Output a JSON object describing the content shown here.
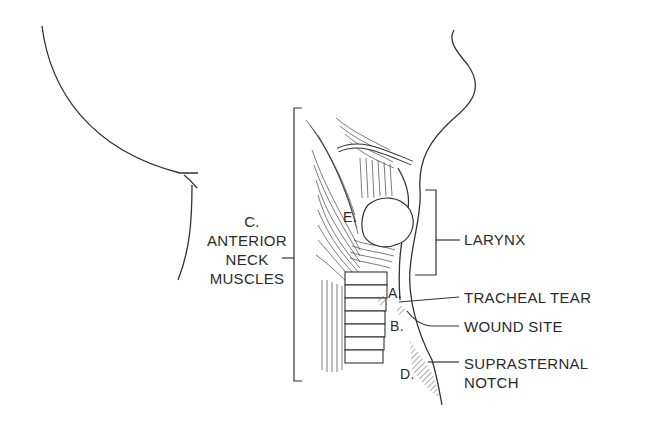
{
  "figure": {
    "colors": {
      "line": "#333333",
      "text": "#2b2b2b",
      "background": "#ffffff"
    },
    "labels": {
      "muscles": {
        "letter": "C.",
        "line1": "ANTERIOR",
        "line2": "NECK",
        "line3": "MUSCLES"
      },
      "larynx": "LARYNX",
      "tracheal_tear": "TRACHEAL TEAR",
      "wound_site": "WOUND SITE",
      "suprasternal_line1": "SUPRASTERNAL",
      "suprasternal_line2": "NOTCH",
      "letters": {
        "a": "A.",
        "b": "B.",
        "d": "D.",
        "e": "E."
      }
    }
  }
}
